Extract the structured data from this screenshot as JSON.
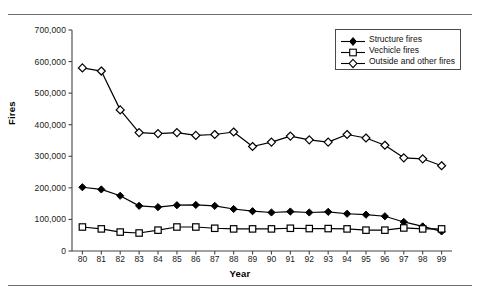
{
  "chart_data": {
    "type": "line",
    "title": "",
    "xlabel": "Year",
    "ylabel": "Fires",
    "x": [
      "80",
      "81",
      "82",
      "83",
      "84",
      "85",
      "86",
      "87",
      "88",
      "89",
      "90",
      "91",
      "92",
      "93",
      "94",
      "95",
      "96",
      "97",
      "98",
      "99"
    ],
    "xtick_labels": [
      "80",
      "81",
      "82",
      "83",
      "84",
      "85",
      "86",
      "87",
      "88",
      "89",
      "90",
      "91",
      "92",
      "93",
      "94",
      "95",
      "96",
      "97",
      "98",
      "99"
    ],
    "ytick_labels": [
      "0",
      "100,000",
      "200,000",
      "300,000",
      "400,000",
      "500,000",
      "600,000",
      "700,000"
    ],
    "ytick_values": [
      0,
      100000,
      200000,
      300000,
      400000,
      500000,
      600000,
      700000
    ],
    "ylim": [
      0,
      700000
    ],
    "grid": false,
    "legend_position": "top-right",
    "series": [
      {
        "name": "Structure fires",
        "marker": "filled-diamond",
        "values": [
          202000,
          195000,
          175000,
          143000,
          139000,
          145000,
          146000,
          143000,
          133000,
          126000,
          122000,
          125000,
          122000,
          124000,
          118000,
          115000,
          110000,
          92000,
          78000,
          62000
        ]
      },
      {
        "name": "Vechicle fires",
        "marker": "open-square",
        "values": [
          76000,
          70000,
          60000,
          57000,
          66000,
          76000,
          76000,
          72000,
          70000,
          70000,
          70000,
          72000,
          71000,
          71000,
          70000,
          66000,
          66000,
          73000,
          70000,
          70000
        ]
      },
      {
        "name": "Outside and other fires",
        "marker": "open-diamond",
        "values": [
          580000,
          570000,
          447000,
          375000,
          372000,
          375000,
          366000,
          369000,
          377000,
          331000,
          345000,
          364000,
          352000,
          345000,
          369000,
          358000,
          335000,
          295000,
          292000,
          270000
        ]
      }
    ]
  },
  "legend": {
    "items": [
      {
        "label": "Structure fires",
        "marker": "filled-diamond"
      },
      {
        "label": "Vechicle fires",
        "marker": "open-square"
      },
      {
        "label": "Outside and other fires",
        "marker": "open-diamond"
      }
    ]
  },
  "axis_titles": {
    "x": "Year",
    "y": "Fires"
  },
  "colors": {
    "line": "#000000",
    "marker_fill": "#000000",
    "marker_open": "#ffffff",
    "rule": "#6b6b6b",
    "text": "#1a1a1a"
  }
}
